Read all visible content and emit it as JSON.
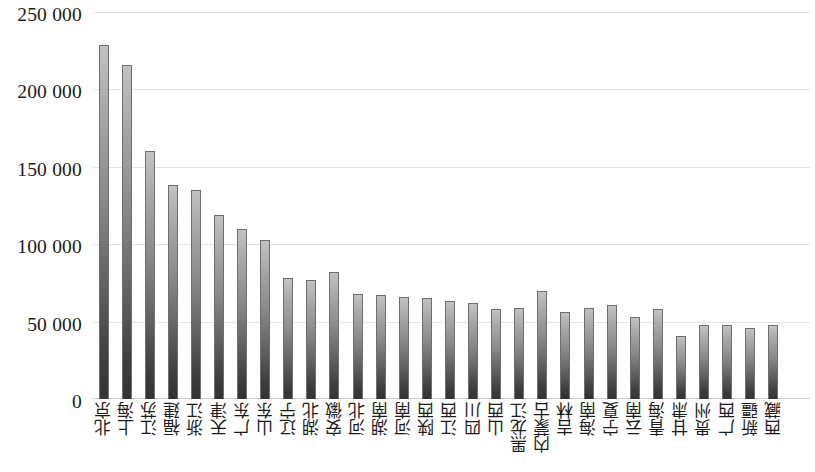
{
  "chart_data": {
    "type": "bar",
    "title": "",
    "subtitle": "",
    "xlabel": "",
    "ylabel": "",
    "ylim": [
      0,
      250000
    ],
    "yticks": [
      0,
      50000,
      100000,
      150000,
      200000,
      250000
    ],
    "ytick_labels": [
      "0",
      "50 000",
      "100 000",
      "150 000",
      "200 000",
      "250 000"
    ],
    "grid": true,
    "legend": "none",
    "bar_fill_top": "#c2c2c2",
    "bar_fill_bottom": "#333333",
    "bar_border": "#6e6e6e",
    "gridline_color": "#e4e4e4",
    "categories": [
      "北京",
      "上海",
      "江苏",
      "福建",
      "浙江",
      "天津",
      "广东",
      "山东",
      "辽宁",
      "湖北",
      "安徽",
      "河北",
      "湖南",
      "河南",
      "陕西",
      "江西",
      "四川",
      "山西",
      "黑龙江",
      "内蒙古",
      "吉林",
      "海南",
      "宁夏",
      "云南",
      "青海",
      "甘肃",
      "贵州",
      "广西",
      "新疆",
      "西藏"
    ],
    "values": [
      229000,
      216000,
      160000,
      138000,
      135000,
      119000,
      110000,
      103000,
      78000,
      77000,
      82000,
      68000,
      67000,
      66000,
      65000,
      63000,
      62000,
      58000,
      59000,
      70000,
      56000,
      59000,
      61000,
      53000,
      58000,
      41000,
      48000,
      48000,
      46000,
      48000
    ]
  }
}
